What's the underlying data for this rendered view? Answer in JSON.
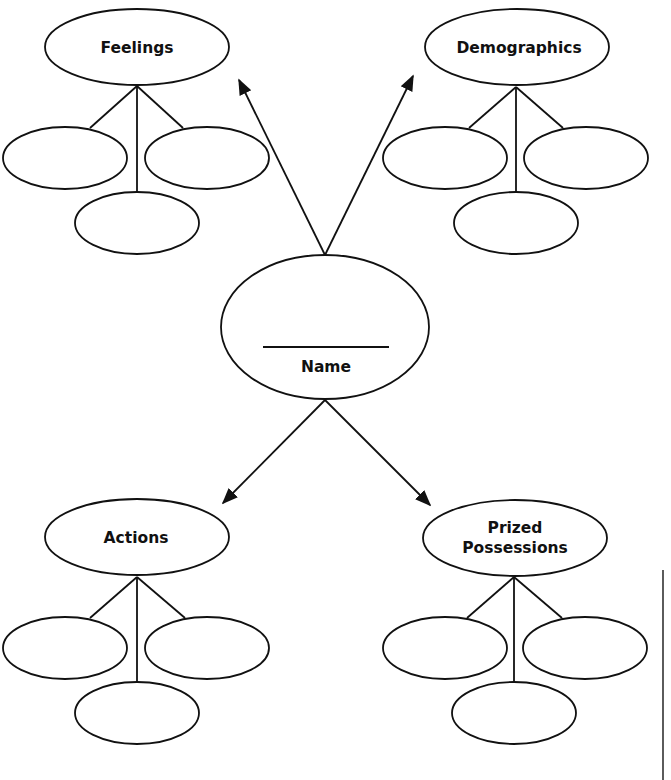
{
  "diagram": {
    "type": "character map / web organizer",
    "center": {
      "label": "Name",
      "has_blank_line": true
    },
    "branches": [
      {
        "label": "Feelings",
        "position": "top-left",
        "children_count": 3
      },
      {
        "label": "Demographics",
        "position": "top-right",
        "children_count": 3
      },
      {
        "label": "Actions",
        "position": "bottom-left",
        "children_count": 3
      },
      {
        "label_line1": "Prized",
        "label_line2": "Possessions",
        "position": "bottom-right",
        "children_count": 3
      }
    ]
  },
  "colors": {
    "stroke": "#111111",
    "background": "#ffffff"
  }
}
